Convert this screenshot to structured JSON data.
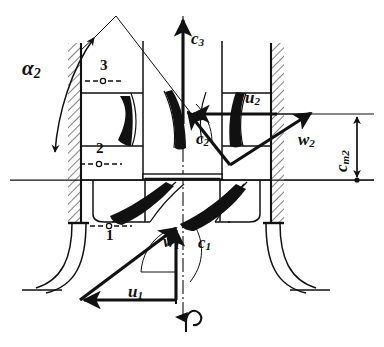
{
  "figure": {
    "type": "engineering-diagram",
    "background_color": "#ffffff",
    "line_color": "#111111",
    "width": 384,
    "height": 347
  },
  "labels": {
    "alpha2": {
      "text": "α",
      "sub": "2",
      "x": 22,
      "y": 70,
      "role": "flow-angle"
    },
    "c3": {
      "text": "c",
      "sub": "3",
      "x": 191,
      "y": 37,
      "role": "absolute-velocity-station-3"
    },
    "c2": {
      "text": "c",
      "sub": "2",
      "x": 196,
      "y": 137,
      "role": "absolute-velocity-station-2"
    },
    "c1": {
      "text": "c",
      "sub": "1",
      "x": 198,
      "y": 241,
      "role": "absolute-velocity-station-1"
    },
    "u2": {
      "text": "u",
      "sub": "2",
      "x": 245,
      "y": 96,
      "role": "blade-speed-station-2"
    },
    "u1": {
      "text": "u",
      "sub": "1",
      "x": 128,
      "y": 290,
      "role": "blade-speed-station-1"
    },
    "w2": {
      "text": "w",
      "sub": "2",
      "x": 298,
      "y": 138,
      "role": "relative-velocity-station-2"
    },
    "w1": {
      "text": "w",
      "sub": "1",
      "x": 163,
      "y": 240,
      "role": "relative-velocity-station-1"
    },
    "cm2": {
      "text": "c",
      "sub": "m2",
      "x": 333,
      "y": 175,
      "role": "meridional-velocity-station-2"
    },
    "station3": {
      "text": "3",
      "x": 100,
      "y": 66,
      "role": "station-marker"
    },
    "station2": {
      "text": "2",
      "x": 96,
      "y": 148,
      "role": "station-marker"
    },
    "station1": {
      "text": "1",
      "x": 106,
      "y": 232,
      "role": "station-marker"
    },
    "rotation": {
      "text": "↺",
      "x": 186,
      "y": 312,
      "role": "shaft-rotation-direction"
    }
  },
  "vectors": {
    "c3": {
      "from": [
        183,
        120
      ],
      "to": [
        183,
        20
      ],
      "style": "solid-arrow",
      "direction": "up"
    },
    "c2": {
      "from": [
        230,
        165
      ],
      "to": [
        187,
        112
      ],
      "style": "solid-arrow",
      "direction": "up-left"
    },
    "u2": {
      "from": [
        277,
        114
      ],
      "to": [
        191,
        114
      ],
      "style": "solid-arrow",
      "direction": "left"
    },
    "w2": {
      "from": [
        230,
        165
      ],
      "to": [
        310,
        114
      ],
      "style": "solid-arrow",
      "direction": "up-right"
    },
    "c1": {
      "from": [
        175,
        300
      ],
      "to": [
        175,
        228
      ],
      "style": "solid-arrow",
      "direction": "up"
    },
    "u1": {
      "from": [
        175,
        300
      ],
      "to": [
        82,
        300
      ],
      "style": "solid-arrow",
      "direction": "left"
    },
    "w1": {
      "from": [
        82,
        300
      ],
      "to": [
        175,
        228
      ],
      "style": "solid-arrow",
      "direction": "up-right"
    },
    "cm2_dimension": {
      "from": [
        357,
        114
      ],
      "to": [
        357,
        180
      ],
      "style": "double-arrow",
      "direction": "vertical"
    }
  },
  "geometry": {
    "axis_y": 180,
    "centerline_x": 183,
    "wall_hatch_angle": 45,
    "walls": [
      "left-outer-wall",
      "right-outer-wall"
    ],
    "stations": [
      {
        "id": "1",
        "label": "1",
        "y": 226
      },
      {
        "id": "2",
        "label": "2",
        "y": 164
      },
      {
        "id": "3",
        "label": "3",
        "y": 81
      }
    ]
  }
}
